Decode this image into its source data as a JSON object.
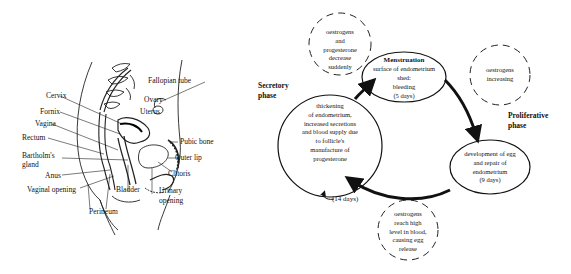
{
  "anatomy": {
    "labels": {
      "fallopian_tube": "Fallopian tube",
      "cervix": "Cervix",
      "ovary": "Ovary",
      "uterus": "Uterus",
      "fornix": "Fornix",
      "vagina": "Vagina",
      "rectum": "Rectum",
      "pubic_bone": "Pubic bone",
      "bartholins_gland_1": "Bartholm's",
      "bartholins_gland_2": "gland",
      "outer_lip": "Outer lip",
      "anus": "Anus",
      "clitoris": "Clitoris",
      "vaginal_opening": "Vaginal opening",
      "bladder": "Bladder",
      "urinary_opening_1": "Urinary",
      "urinary_opening_2": "opening",
      "perineum": "Perineum"
    }
  },
  "cycle": {
    "phases": {
      "secretory": [
        "Secretory",
        "phase"
      ],
      "proliferative": [
        "Proliferative",
        "phase"
      ]
    },
    "stages": {
      "menstruation": {
        "title": "Menstruation",
        "lines": [
          "surface of endometrium",
          "shed:",
          "bleeding",
          "(5 days)"
        ]
      },
      "proliferative": {
        "lines": [
          "development of egg",
          "and repair of",
          "endometrium",
          "(9 days)"
        ]
      },
      "secretory": {
        "lines": [
          "thickening",
          "of endometrium,",
          "increased secretions",
          "and blood supply due",
          "to follicle's",
          "manufacture of",
          "progesterone"
        ]
      }
    },
    "hormones": {
      "decrease": [
        "oestrogens",
        "and",
        "progesterone",
        "decrease",
        "suddenly"
      ],
      "increasing": [
        "oestrogens",
        "increasing"
      ],
      "high": [
        "oestrogens",
        "reach high",
        "level in blood,",
        "causing egg",
        "release"
      ]
    },
    "duration_label": "(14 days)"
  }
}
